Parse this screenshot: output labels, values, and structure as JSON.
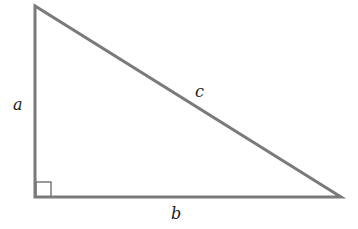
{
  "diagram": {
    "type": "right-triangle",
    "stroke_color": "#7a7a7a",
    "label_color": "#222222",
    "vertices": {
      "top": [
        35,
        6
      ],
      "right_angle": [
        35,
        197
      ],
      "right": [
        341,
        197
      ]
    },
    "labels": {
      "a": "a",
      "b": "b",
      "c": "c"
    },
    "right_angle_marker": true
  }
}
